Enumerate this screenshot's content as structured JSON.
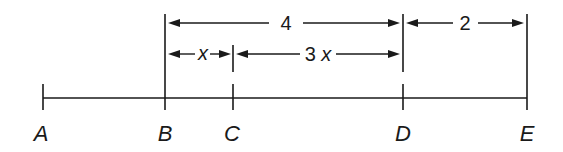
{
  "diagram": {
    "type": "number-line-segments",
    "colors": {
      "ink": "#1a1a1a",
      "background": "#ffffff"
    },
    "main_line": {
      "y": 98,
      "x_start": 43,
      "x_end": 527
    },
    "points": [
      {
        "id": "A",
        "label": "A",
        "x": 43
      },
      {
        "id": "B",
        "label": "B",
        "x": 165
      },
      {
        "id": "C",
        "label": "C",
        "x": 233
      },
      {
        "id": "D",
        "label": "D",
        "x": 403
      },
      {
        "id": "E",
        "label": "E",
        "x": 527
      }
    ],
    "dimensions": [
      {
        "id": "BD",
        "from": "B",
        "to": "D",
        "label": "4",
        "row": 1,
        "y": 23
      },
      {
        "id": "DE",
        "from": "D",
        "to": "E",
        "label": "2",
        "row": 1,
        "y": 23
      },
      {
        "id": "BC",
        "from": "B",
        "to": "C",
        "label": "x",
        "row": 2,
        "y": 54
      },
      {
        "id": "CD",
        "from": "C",
        "to": "D",
        "label": "3x",
        "row": 2,
        "y": 54
      }
    ]
  }
}
